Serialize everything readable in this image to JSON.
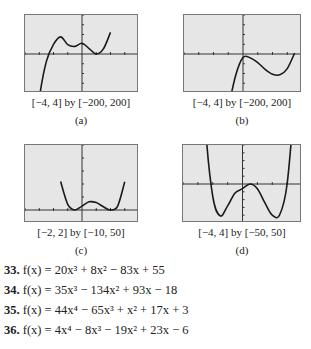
{
  "chart_data": [
    {
      "type": "line",
      "label": "(a)",
      "window_caption": "[−4, 4] by [−200, 200]",
      "xlim": [
        -4,
        4
      ],
      "ylim": [
        -200,
        200
      ],
      "xscale": 1,
      "yscale": 50,
      "grid": false,
      "description": "cubic with local max near x=-1.5 (y~120) and local min touching x-axis near x=1",
      "x": [
        -4,
        -3.5,
        -3,
        -2.5,
        -2,
        -1.5,
        -1,
        -0.5,
        0,
        0.5,
        1,
        1.5,
        2
      ],
      "y": [
        -1001,
        -543,
        -229,
        -38,
        49,
        88,
        48,
        39,
        55,
        28,
        0,
        26,
        111
      ]
    },
    {
      "type": "line",
      "label": "(b)",
      "window_caption": "[−4, 4] by [−200, 200]",
      "xlim": [
        -4,
        4
      ],
      "ylim": [
        -200,
        200
      ],
      "xscale": 1,
      "yscale": 50,
      "grid": false,
      "description": "cubic rising, local max near x=0.4 (~0), local min near x=2.2 (~-100), crossing zero near x=3",
      "x": [
        -1,
        -0.5,
        0,
        0.5,
        1,
        1.5,
        2,
        2.5,
        3,
        3.5
      ],
      "y": [
        -280,
        -110,
        -18,
        -20,
        -44,
        -79,
        -104,
        -107,
        -75,
        5
      ]
    },
    {
      "type": "line",
      "label": "(c)",
      "window_caption": "[−2, 2] by [−10, 50]",
      "xlim": [
        -2,
        2
      ],
      "ylim": [
        -10,
        50
      ],
      "xscale": 0.5,
      "yscale": 10,
      "grid": false,
      "description": "quartic W-shape with two minima touching x-axis near x=-0.3 and x=1, small local max near x=0.4",
      "x": [
        -0.75,
        -0.5,
        -0.25,
        0,
        0.25,
        0.5,
        0.75,
        1,
        1.25,
        1.5
      ],
      "y": [
        21.9,
        4.3,
        0.0,
        3.0,
        6.3,
        5.7,
        2.5,
        0.0,
        3.0,
        21.8
      ]
    },
    {
      "type": "line",
      "label": "(d)",
      "window_caption": "[−4, 4] by [−50, 50]",
      "xlim": [
        -4,
        4
      ],
      "ylim": [
        -50,
        50
      ],
      "xscale": 1,
      "yscale": 10,
      "grid": false,
      "description": "quartic W-shape with minima near x=-1.7 (~-45) and x=2.3 (~-45), local max near x=0.6 (~0)",
      "x": [
        -3,
        -2.5,
        -2,
        -1.5,
        -1,
        -0.5,
        0,
        0.5,
        1,
        1.5,
        2,
        2.5,
        3,
        3.5
      ],
      "y": [
        264,
        77.1,
        -16,
        -40.9,
        -28,
        -11.6,
        -6,
        0,
        -6,
        -23.9,
        -40,
        -39.4,
        0,
        106.9
      ]
    }
  ],
  "panels": [
    {
      "caption": "[−4, 4] by [−200, 200]",
      "letter": "(a)"
    },
    {
      "caption": "[−4, 4] by [−200, 200]",
      "letter": "(b)"
    },
    {
      "caption": "[−2, 2] by [−10, 50]",
      "letter": "(c)"
    },
    {
      "caption": "[−4, 4] by [−50, 50]",
      "letter": "(d)"
    }
  ],
  "exercises": [
    {
      "num": "33.",
      "lhs": "f(x) = ",
      "terms": [
        "20x³ + 8x² − 83x + 55"
      ]
    },
    {
      "num": "34.",
      "lhs": "f(x) = ",
      "terms": [
        "35x³ − 134x² + 93x − 18"
      ]
    },
    {
      "num": "35.",
      "lhs": "f(x) = ",
      "terms": [
        "44x⁴ − 65x³ + x² + 17x + 3"
      ]
    },
    {
      "num": "36.",
      "lhs": "f(x) = ",
      "terms": [
        "4x⁴ − 8x³ − 19x² + 23x − 6"
      ]
    }
  ],
  "colors": {
    "screen_bg": "#e6e6e6",
    "curve": "#1a1a1a",
    "axis": "#333333",
    "border": "#777777"
  }
}
